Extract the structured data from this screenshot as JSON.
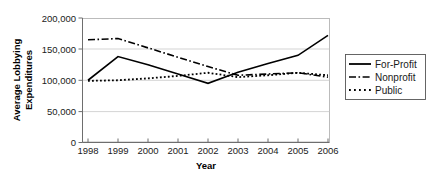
{
  "chart_data": {
    "type": "line",
    "title": "",
    "xlabel": "Year",
    "ylabel": "Average Lobbying Expenditures",
    "x": [
      "1998",
      "1999",
      "2000",
      "2001",
      "2002",
      "2003",
      "2004",
      "2005",
      "2006"
    ],
    "categories": [
      "1998",
      "1999",
      "2000",
      "2001",
      "2002",
      "2003",
      "2004",
      "2005",
      "2006"
    ],
    "ylim": [
      0,
      200000
    ],
    "yticks": [
      0,
      50000,
      100000,
      150000,
      200000
    ],
    "ytick_labels": [
      "0",
      "50,000",
      "100,000",
      "150,000",
      "200,000"
    ],
    "grid": true,
    "grid_axis": "y",
    "legend_position": "right",
    "series": [
      {
        "name": "For-Profit",
        "style": "solid",
        "color": "#000000",
        "values": [
          100000,
          138000,
          125000,
          110000,
          95000,
          113000,
          127000,
          140000,
          172000
        ]
      },
      {
        "name": "Nonprofit",
        "style": "dash-dot",
        "color": "#000000",
        "values": [
          165000,
          167000,
          152000,
          137000,
          122000,
          108000,
          110000,
          112000,
          105000
        ]
      },
      {
        "name": "Public",
        "style": "dotted",
        "color": "#000000",
        "values": [
          99000,
          100000,
          103000,
          107000,
          112000,
          105000,
          108000,
          112000,
          108000
        ]
      }
    ]
  },
  "axes": {
    "y_title": "Average Lobbying Expenditures",
    "x_title": "Year",
    "y_tick_0": "0",
    "y_tick_1": "50,000",
    "y_tick_2": "100,000",
    "y_tick_3": "150,000",
    "y_tick_4": "200,000",
    "x_tick_0": "1998",
    "x_tick_1": "1999",
    "x_tick_2": "2000",
    "x_tick_3": "2001",
    "x_tick_4": "2002",
    "x_tick_5": "2003",
    "x_tick_6": "2004",
    "x_tick_7": "2005",
    "x_tick_8": "2006"
  },
  "legend": {
    "items": [
      {
        "label": "For-Profit",
        "style": "solid"
      },
      {
        "label": "Nonprofit",
        "style": "dash-dot"
      },
      {
        "label": "Public",
        "style": "dotted"
      }
    ]
  }
}
